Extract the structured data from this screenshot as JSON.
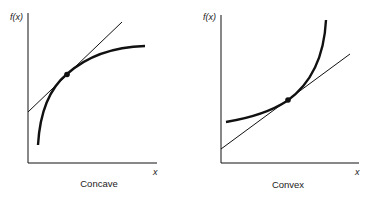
{
  "panels": [
    {
      "caption": "Concave",
      "y_label": "f(x)",
      "x_label": "x"
    },
    {
      "caption": "Convex",
      "y_label": "f(x)",
      "x_label": "x"
    }
  ],
  "colors": {
    "ink": "#111111",
    "background": "#ffffff"
  }
}
